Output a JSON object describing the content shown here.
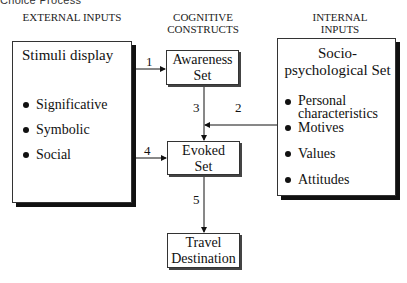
{
  "figure_title_partial": "Choice Process",
  "columns": {
    "external": "EXTERNAL INPUTS",
    "cognitive": "COGNITIVE CONSTRUCTS",
    "internal": "INTERNAL INPUTS"
  },
  "external_box": {
    "title": "Stimuli display",
    "items": [
      "Significative",
      "Symbolic",
      "Social"
    ]
  },
  "internal_box": {
    "title_line1": "Socio-",
    "title_line2": "psychological Set",
    "items": [
      "Personal characteristics",
      "Motives",
      "Values",
      "Attitudes"
    ]
  },
  "nodes": {
    "awareness": {
      "line1": "Awareness",
      "line2": "Set"
    },
    "evoked": {
      "line1": "Evoked",
      "line2": "Set"
    },
    "destination": {
      "line1": "Travel",
      "line2": "Destination"
    }
  },
  "arrows": {
    "a1": "1",
    "a2": "2",
    "a3": "3",
    "a4": "4",
    "a5": "5"
  }
}
